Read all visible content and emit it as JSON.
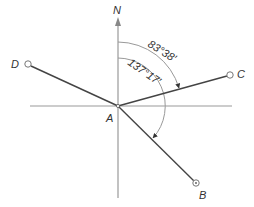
{
  "diagram": {
    "type": "bearing-diagram",
    "north_label": "N",
    "points": {
      "A": {
        "label": "A",
        "x": 118,
        "y": 106,
        "lx": 106,
        "ly": 122
      },
      "B": {
        "label": "B",
        "x": 196,
        "y": 183,
        "lx": 199,
        "ly": 199
      },
      "C": {
        "label": "C",
        "x": 230,
        "y": 75,
        "lx": 237,
        "ly": 77
      },
      "D": {
        "label": "D",
        "x": 28,
        "y": 64,
        "lx": 11,
        "ly": 68
      }
    },
    "angles": [
      {
        "label": "83°38′",
        "from": "N",
        "to": "AC",
        "radius": 64
      },
      {
        "label": "137°17′",
        "from": "N",
        "to": "AB",
        "radius": 48
      }
    ],
    "colors": {
      "axis": "#999999",
      "line": "#444444",
      "arc": "#888888",
      "text": "#333333"
    }
  }
}
